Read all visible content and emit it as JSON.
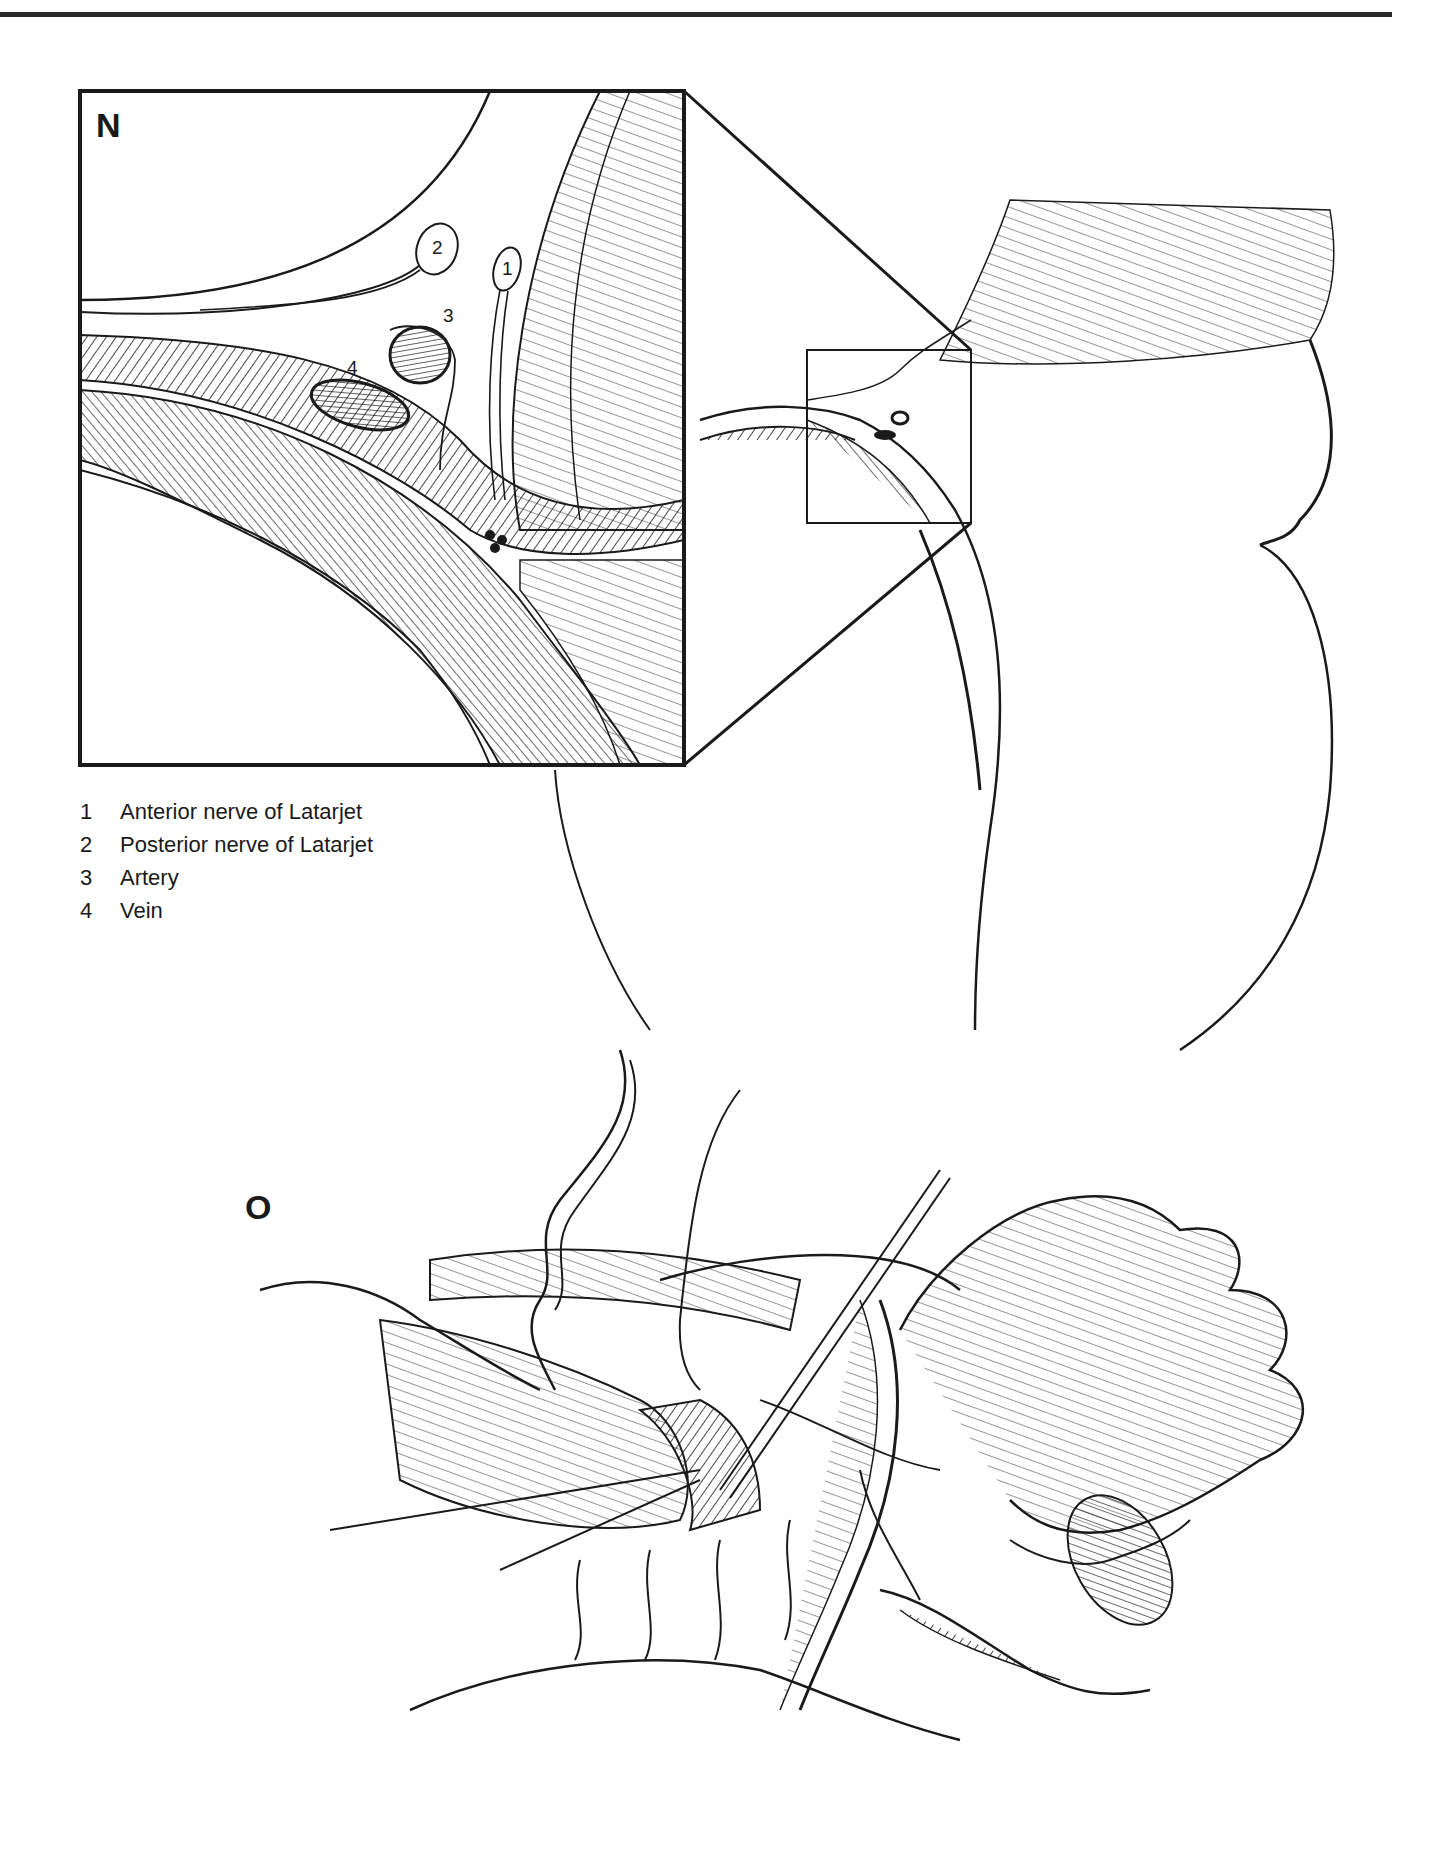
{
  "figure": {
    "top_rule": true,
    "panels": [
      {
        "id": "N",
        "label": "N",
        "description": "Magnified cross-section inset showing vessels and nerves of Latarjet"
      },
      {
        "id": "O",
        "label": "O",
        "description": "Operative view with forceps and ligatures"
      }
    ],
    "callouts": [
      {
        "number": "1"
      },
      {
        "number": "2"
      },
      {
        "number": "3"
      },
      {
        "number": "4"
      }
    ],
    "legend": [
      {
        "number": "1",
        "text": "Anterior nerve of Latarjet"
      },
      {
        "number": "2",
        "text": "Posterior nerve of Latarjet"
      },
      {
        "number": "3",
        "text": "Artery"
      },
      {
        "number": "4",
        "text": "Vein"
      }
    ],
    "colors": {
      "ink": "#1a1a1a",
      "paper": "#ffffff"
    }
  }
}
